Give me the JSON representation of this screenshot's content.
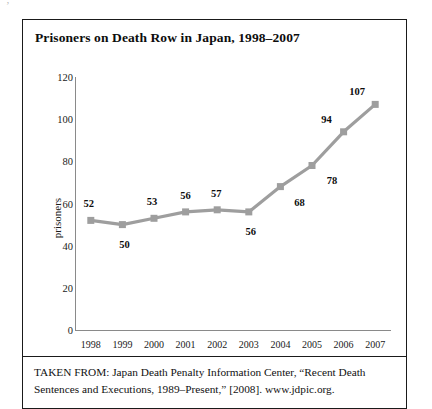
{
  "figure": {
    "title": "Prisoners on Death Row in Japan, 1998–2007",
    "speck": "’",
    "source_note": "TAKEN FROM: Japan Death Penalty Information Center, “Recent Death Sentences and Executions, 1989–Present,” [2008]. www.jdpic.org.",
    "frame_color": "#1a1a1a"
  },
  "chart_data": {
    "type": "line",
    "title": "Prisoners on Death Row in Japan, 1998–2007",
    "xlabel": "",
    "ylabel": "prisoners",
    "categories": [
      "1998",
      "1999",
      "2000",
      "2001",
      "2002",
      "2003",
      "2004",
      "2005",
      "2006",
      "2007"
    ],
    "values": [
      52,
      50,
      53,
      56,
      57,
      56,
      68,
      78,
      94,
      107
    ],
    "data_labels": [
      "52",
      "50",
      "53",
      "56",
      "57",
      "56",
      "68",
      "78",
      "94",
      "107"
    ],
    "ylim": [
      0,
      120
    ],
    "yticks": [
      0,
      20,
      40,
      60,
      80,
      100,
      120
    ],
    "ytick_labels": [
      "0",
      "20",
      "40",
      "60",
      "80",
      "100",
      "120"
    ],
    "grid": false,
    "legend": false,
    "series_color": "#9e9e9e",
    "marker": "square",
    "axis_color": "#8a8a8a"
  }
}
